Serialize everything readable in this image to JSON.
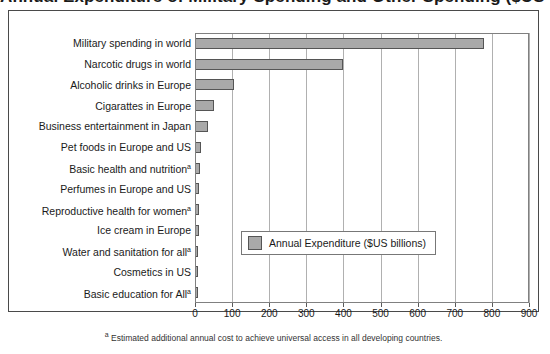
{
  "chart_data": {
    "type": "bar",
    "orientation": "horizontal",
    "title": "Annual Expenditure of Military Spending and Other Spending ($US billions)",
    "xlabel": "",
    "ylabel": "",
    "xlim": [
      0,
      900
    ],
    "xticks": [
      0,
      100,
      200,
      300,
      400,
      500,
      600,
      700,
      800,
      900
    ],
    "grid": true,
    "legend_position": "center-right-inside",
    "legend": [
      "Annual Expenditure ($US billions)"
    ],
    "series_name": "Annual Expenditure ($US billions)",
    "categories": [
      "Military spending in world",
      "Narcotic drugs in world",
      "Alcoholic drinks in Europe",
      "Cigarattes in Europe",
      "Business entertainment in Japan",
      "Pet foods in Europe and US",
      "Basic health and nutrition",
      "Perfumes in Europe and US",
      "Reproductive health for women",
      "Ice cream in Europe",
      "Water and sanitation for all",
      "Cosmetics in US",
      "Basic education for All"
    ],
    "category_footnote_markers": [
      false,
      false,
      false,
      false,
      false,
      false,
      true,
      false,
      true,
      false,
      true,
      false,
      true
    ],
    "values": [
      780,
      400,
      105,
      50,
      35,
      17,
      13,
      12,
      12,
      11,
      9,
      8,
      6
    ],
    "annotations": {
      "footnote_marker": "a",
      "footnote": "Estimated additional annual cost to achieve universal access in all developing countries."
    },
    "colors": {
      "bar_fill": "#a9a9a9",
      "bar_edge": "#555555",
      "grid": "#b0b0b0",
      "frame": "#4a4a4a",
      "text": "#1a1a1a",
      "background": "#ffffff"
    }
  }
}
